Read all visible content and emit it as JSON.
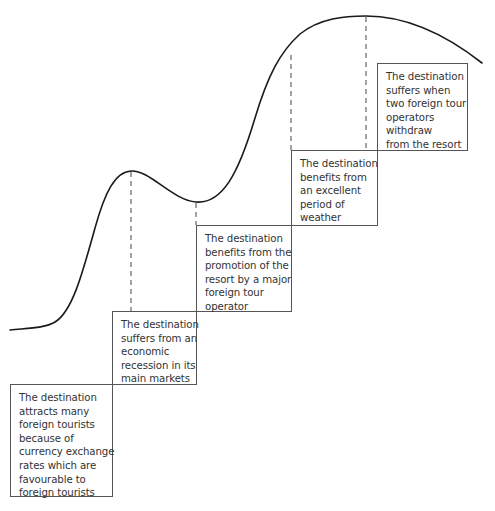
{
  "diagram": {
    "type": "destination life-cycle curve with event staircase",
    "colors": {
      "curve": "#1a1a1a",
      "dashed": "#444444",
      "box_border": "#555555",
      "text": "#333333"
    },
    "curve_path": "M10 330 C 30 328, 45 328, 55 322 C 72 312, 82 275, 95 228 C 105 192, 115 172, 131 171 C 150 170, 172 200, 196 202 C 222 204, 238 175, 255 118 C 268 75, 280 52, 300 34 C 320 18, 345 16, 366 16 C 400 16, 440 30, 482 63",
    "dashed_lines": [
      {
        "x": 131,
        "y1": 172,
        "y2": 311
      },
      {
        "x": 196,
        "y1": 203,
        "y2": 225
      },
      {
        "x": 291,
        "y1": 55,
        "y2": 150
      },
      {
        "x": 366,
        "y1": 17,
        "y2": 150
      }
    ],
    "boxes": [
      {
        "id": "currency",
        "left": 10,
        "top": 384,
        "width": 103,
        "height": 113,
        "lines": [
          "The destination",
          "attracts many",
          "foreign tourists",
          "because of",
          "currency exchange",
          "rates which are",
          "favourable to",
          "foreign tourists"
        ]
      },
      {
        "id": "recession",
        "left": 112,
        "top": 311,
        "width": 85,
        "height": 74,
        "lines": [
          "The destination",
          "suffers from an",
          "economic",
          "recession in its",
          "main markets"
        ]
      },
      {
        "id": "promotion",
        "left": 196,
        "top": 225,
        "width": 96,
        "height": 87,
        "lines": [
          "The destination",
          "benefits from the",
          "promotion of the",
          "resort by a major",
          "foreign tour",
          "operator"
        ]
      },
      {
        "id": "weather",
        "left": 291,
        "top": 150,
        "width": 87,
        "height": 76,
        "lines": [
          "The destination",
          "benefits from",
          "an excellent",
          "period of",
          "weather"
        ]
      },
      {
        "id": "withdraw",
        "left": 377,
        "top": 63,
        "width": 91,
        "height": 88,
        "lines": [
          "The destination",
          "suffers when",
          "two foreign tour",
          "operators",
          "withdraw",
          "from the resort"
        ]
      }
    ]
  }
}
